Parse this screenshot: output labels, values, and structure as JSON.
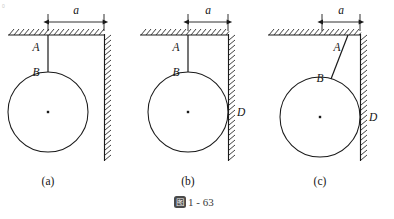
{
  "figure": {
    "caption_badge": "图",
    "caption_number": "1 - 63",
    "corner_mark": "0"
  },
  "labels": {
    "dim_a": "a",
    "point_a": "A",
    "point_b": "B",
    "point_d": "D"
  },
  "panels": [
    {
      "id": "a",
      "caption": "(a)",
      "dim_label": "a",
      "point_labels": [
        "A",
        "B"
      ],
      "has_contact_point_d": false,
      "string_tilted": false,
      "description": "Sphere hangs on a vertical string from ceiling; sphere does not touch the wall"
    },
    {
      "id": "b",
      "caption": "(b)",
      "dim_label": "a",
      "point_labels": [
        "A",
        "B",
        "D"
      ],
      "has_contact_point_d": true,
      "string_tilted": false,
      "description": "Sphere hangs on a vertical string and just touches the wall at D"
    },
    {
      "id": "c",
      "caption": "(c)",
      "dim_label": "a",
      "point_labels": [
        "A",
        "B",
        "D"
      ],
      "has_contact_point_d": true,
      "string_tilted": true,
      "description": "Sphere hangs on a tilted string and presses against the wall at D"
    }
  ],
  "colors": {
    "ink": "#1a1a1a",
    "hatch": "#2a2a2a",
    "paper": "#ffffff",
    "badge": "#4a4a4a"
  },
  "geometry": {
    "panel_a": {
      "ceiling_y": 35,
      "ceiling_x_start": 8,
      "ceiling_x_end": 104,
      "wall_x": 104,
      "wall_y_top": 35,
      "wall_y_bottom": 160,
      "string_x": 48,
      "string_y_top": 35,
      "string_y_bottom": 72,
      "circle_cx": 48,
      "circle_cy": 112,
      "circle_r": 40,
      "dim_y": 20,
      "dim_x_left": 48,
      "dim_x_right": 104
    },
    "panel_b": {
      "ceiling_y": 35,
      "ceiling_x_start": 140,
      "ceiling_x_end": 228,
      "wall_x": 228,
      "wall_y_top": 35,
      "wall_y_bottom": 160,
      "string_x": 188,
      "string_y_top": 35,
      "string_y_bottom": 72,
      "circle_cx": 188,
      "circle_cy": 112,
      "circle_r": 40,
      "dim_y": 20,
      "dim_x_left": 188,
      "dim_x_right": 228
    },
    "panel_c": {
      "ceiling_y": 35,
      "ceiling_x_start": 268,
      "ceiling_x_end": 360,
      "wall_x": 360,
      "wall_y_top": 35,
      "wall_y_bottom": 160,
      "string_x_top": 348,
      "string_y_top": 35,
      "string_x_bottom": 332,
      "string_y_bottom": 78,
      "circle_cx": 320,
      "circle_cy": 117,
      "circle_r": 40,
      "dim_y": 20,
      "dim_x_left": 322,
      "dim_x_right": 360
    }
  }
}
